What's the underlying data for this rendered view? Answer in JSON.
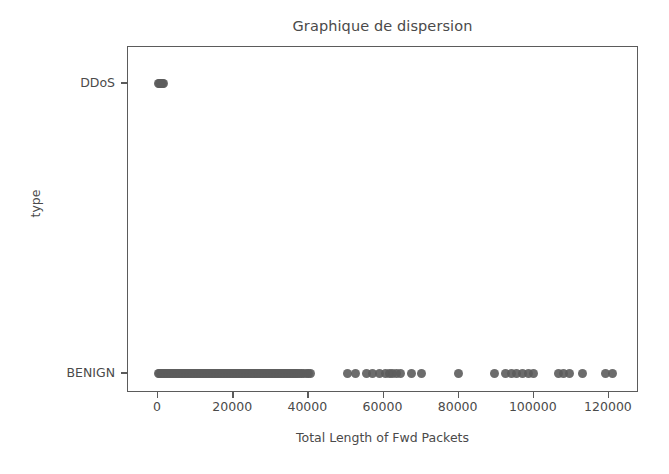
{
  "chart_data": {
    "type": "scatter",
    "title": "Graphique de dispersion",
    "xlabel": "Total Length of Fwd Packets",
    "ylabel": "type",
    "xlim": [
      -8000,
      128000
    ],
    "xticks": [
      0,
      20000,
      40000,
      60000,
      80000,
      100000,
      120000
    ],
    "xtick_labels": [
      "0",
      "20000",
      "40000",
      "60000",
      "80000",
      "100000",
      "120000"
    ],
    "ycategories": [
      "BENIGN",
      "DDoS"
    ],
    "ytick_labels": [
      "DDoS",
      "BENIGN"
    ],
    "grid": false,
    "legend": null,
    "marker_color": "#5c5c5c",
    "marker_size": 9,
    "series": [
      {
        "name": "DDoS",
        "y": "DDoS",
        "x": [
          0,
          300,
          600,
          900,
          1200,
          1500
        ]
      },
      {
        "name": "BENIGN",
        "y": "BENIGN",
        "x": [
          0,
          400,
          800,
          1200,
          1600,
          2000,
          2400,
          2800,
          3200,
          3600,
          4000,
          4400,
          4800,
          5200,
          5600,
          6000,
          6400,
          6800,
          7200,
          7600,
          8000,
          8400,
          8800,
          9200,
          9600,
          10000,
          10400,
          10800,
          11200,
          11600,
          12000,
          12400,
          12800,
          13200,
          13600,
          14000,
          14400,
          14800,
          15200,
          15600,
          16000,
          16400,
          16800,
          17200,
          17600,
          18000,
          18400,
          18800,
          19200,
          19600,
          20000,
          20400,
          20800,
          21200,
          21600,
          22000,
          22400,
          22800,
          23200,
          23600,
          24000,
          24400,
          24800,
          25200,
          25600,
          26000,
          26400,
          26800,
          27200,
          27600,
          28000,
          28400,
          28800,
          29200,
          29600,
          30000,
          30400,
          30800,
          31200,
          31600,
          32000,
          32400,
          32800,
          33200,
          33600,
          34000,
          34400,
          34800,
          35200,
          35600,
          36000,
          36400,
          36800,
          37200,
          37600,
          38200,
          38800,
          39400,
          40000,
          40600,
          50500,
          52500,
          55500,
          57000,
          59000,
          60500,
          61500,
          62500,
          63500,
          64500,
          67500,
          70000,
          80000,
          89500,
          92500,
          94000,
          95500,
          97000,
          98500,
          100000,
          106500,
          108000,
          109500,
          113000,
          119000,
          121000
        ]
      }
    ],
    "point_count_note": "dense overlapping band from 0 to ~41000 on BENIGN row"
  },
  "figure": {
    "background_color": "#ffffff",
    "axis_color": "#5b5b5b",
    "text_color": "#4a4a4a"
  }
}
